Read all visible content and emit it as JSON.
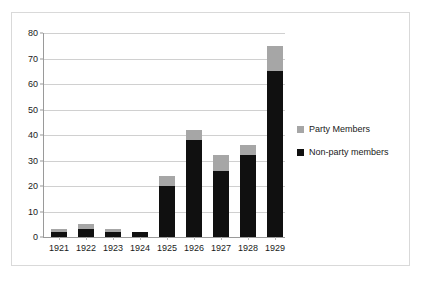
{
  "chart_data": {
    "type": "bar",
    "subtype": "stacked-vertical-bar",
    "title": "",
    "xlabel": "",
    "ylabel": "",
    "categories": [
      "1921",
      "1922",
      "1923",
      "1924",
      "1925",
      "1926",
      "1927",
      "1928",
      "1929"
    ],
    "series": [
      {
        "name": "Non-party members",
        "color": "#101010",
        "values": [
          2,
          3,
          2,
          2,
          20,
          38,
          26,
          32,
          65
        ]
      },
      {
        "name": "Party Members",
        "color": "#a6a6a6",
        "values": [
          1,
          2,
          1,
          0,
          4,
          4,
          6,
          4,
          10
        ]
      }
    ],
    "stack_totals": [
      3,
      5,
      3,
      2,
      24,
      42,
      32,
      36,
      75
    ],
    "ylim": [
      0,
      80
    ],
    "ytick_values": [
      0,
      10,
      20,
      30,
      40,
      50,
      60,
      70,
      80
    ],
    "ytick_labels": [
      "0",
      "10",
      "20",
      "30",
      "40",
      "50",
      "60",
      "70",
      "80"
    ],
    "grid": true,
    "grid_axis": "y",
    "legend_position": "right",
    "legend_order": [
      "Party Members",
      "Non-party members"
    ],
    "stack_order_bottom_to_top": [
      "Non-party members",
      "Party Members"
    ],
    "plot_background": "#ffffff",
    "border_color": "#d9d9d9",
    "gridline_color": "#d0d0d0",
    "axis_color": "#9a9a9a"
  },
  "legend": {
    "entries": [
      {
        "label": "Party Members",
        "color": "#a6a6a6",
        "swatch_name": "legend-swatch-party-members"
      },
      {
        "label": "Non-party members",
        "color": "#101010",
        "swatch_name": "legend-swatch-non-party-members"
      }
    ]
  }
}
